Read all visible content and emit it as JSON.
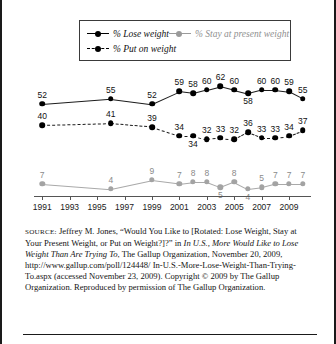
{
  "legend": {
    "entries": [
      {
        "label": "% Lose weight",
        "marker": "solid-black-dot",
        "color": "#000000"
      },
      {
        "label": "% Stay at present weight",
        "marker": "solid-gray-dot",
        "color": "#9a9a9a"
      },
      {
        "label": "% Put on weight",
        "marker": "dashed-black-dot",
        "color": "#000000"
      }
    ]
  },
  "source": {
    "kicker": "source:",
    "line1": "Jeffrey M. Jones, “Would You Like to [Rotated: Lose Weight,",
    "line2a": "Stay at Your Present Weight, or Put on Weight?]?” in ",
    "line2b": "In U.S., More",
    "line3a": "Would Like to Lose Weight Than Are Trying To",
    "line3b": ", The Gallup",
    "line4": "Organization, November 20, 2009, http://www.gallup.com/poll/124448/",
    "line5": "In-U.S.-More-Lose-Weight-Than-Trying-To.aspx (accessed",
    "line6": "November 23, 2009). Copyright © 2009 by The Gallup Organization.",
    "line7": "Reproduced by permission of The Gallup Organization."
  },
  "chart_data": {
    "type": "line",
    "title": "",
    "xlabel": "",
    "ylabel": "",
    "grid": false,
    "legend_position": "top",
    "xlim": [
      1990.4,
      2010.6
    ],
    "ylim": [
      0,
      70
    ],
    "x": [
      1991,
      1996,
      1999,
      2001,
      2002,
      2003,
      2004,
      2005,
      2006,
      2007,
      2008,
      2009,
      2010
    ],
    "tick_labels": [
      "1991",
      "1993",
      "1995",
      "1997",
      "1999",
      "2001",
      "2003",
      "2005",
      "2007",
      "2009"
    ],
    "tick_values": [
      1991,
      1993,
      1995,
      1997,
      1999,
      2001,
      2003,
      2005,
      2007,
      2009
    ],
    "series": [
      {
        "name": "% Lose weight",
        "color": "#000000",
        "style": "solid",
        "x": [
          1991,
          1996,
          1999,
          2001,
          2002,
          2003,
          2004,
          2005,
          2006,
          2007,
          2008,
          2009,
          2010
        ],
        "values": [
          52,
          55,
          52,
          59,
          58,
          60,
          62,
          60,
          58,
          60,
          60,
          59,
          55
        ],
        "labels": [
          "52",
          "55",
          "52",
          "59",
          "58",
          "60",
          "62",
          "60",
          "58",
          "60",
          "60",
          "59",
          "55"
        ]
      },
      {
        "name": "% Put on weight",
        "color": "#000000",
        "style": "dashed",
        "x": [
          1991,
          1996,
          1999,
          2001,
          2002,
          2003,
          2004,
          2005,
          2006,
          2007,
          2008,
          2009,
          2010
        ],
        "values": [
          40,
          41,
          39,
          34,
          34,
          32,
          33,
          32,
          36,
          33,
          33,
          34,
          37
        ],
        "labels": [
          "40",
          "41",
          "39",
          "34",
          "34",
          "32",
          "33",
          "32",
          "36",
          "33",
          "33",
          "34",
          "37"
        ]
      },
      {
        "name": "% Stay at present weight",
        "color": "#a3a3a3",
        "style": "solid",
        "x": [
          1991,
          1996,
          1999,
          2001,
          2002,
          2003,
          2004,
          2005,
          2006,
          2007,
          2008,
          2009,
          2010
        ],
        "values": [
          7,
          4,
          9,
          7,
          8,
          8,
          5,
          8,
          4,
          5,
          7,
          7,
          7
        ],
        "labels": [
          "7",
          "4",
          "9",
          "7",
          "8",
          "8",
          "5",
          "8",
          "4",
          "5",
          "7",
          "7",
          "7"
        ]
      }
    ]
  }
}
